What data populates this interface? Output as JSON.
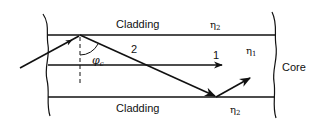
{
  "diagram": {
    "labels": {
      "cladding_top": "Cladding",
      "cladding_bottom": "Cladding",
      "eta2_top": "η",
      "eta2_top_sub": "2",
      "eta2_bottom": "η",
      "eta2_bottom_sub": "2",
      "eta1": "η",
      "eta1_sub": "1",
      "core": "Core",
      "ray2": "2",
      "ray1": "1",
      "critical_angle": "φ",
      "critical_angle_sub": "c"
    },
    "colors": {
      "line": "#111111",
      "background": "#ffffff"
    }
  }
}
